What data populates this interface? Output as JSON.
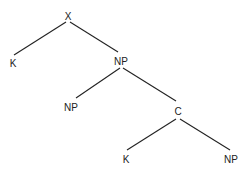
{
  "diagram": {
    "type": "syntax-tree",
    "nodes": [
      {
        "id": "x",
        "label": "X",
        "x": 68,
        "y": 20
      },
      {
        "id": "k1",
        "label": "K",
        "x": 13,
        "y": 67
      },
      {
        "id": "np1",
        "label": "NP",
        "x": 121,
        "y": 65
      },
      {
        "id": "np2",
        "label": "NP",
        "x": 71,
        "y": 111
      },
      {
        "id": "c",
        "label": "C",
        "x": 178,
        "y": 115
      },
      {
        "id": "k2",
        "label": "K",
        "x": 126,
        "y": 163
      },
      {
        "id": "np3",
        "label": "NP",
        "x": 231,
        "y": 163
      }
    ],
    "edges": [
      {
        "from": "x",
        "to": "k1"
      },
      {
        "from": "x",
        "to": "np1"
      },
      {
        "from": "np1",
        "to": "np2"
      },
      {
        "from": "np1",
        "to": "c"
      },
      {
        "from": "c",
        "to": "k2"
      },
      {
        "from": "c",
        "to": "np3"
      }
    ]
  }
}
